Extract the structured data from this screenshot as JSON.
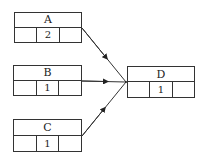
{
  "diagram": {
    "nodes": [
      {
        "id": "A",
        "label": "A",
        "cells": [
          "",
          "2",
          ""
        ],
        "x": 14,
        "y": 12,
        "w": 68,
        "h": 31
      },
      {
        "id": "B",
        "label": "B",
        "cells": [
          "",
          "1",
          ""
        ],
        "x": 13,
        "y": 65,
        "w": 69,
        "h": 31
      },
      {
        "id": "C",
        "label": "C",
        "cells": [
          "",
          "1",
          ""
        ],
        "x": 13,
        "y": 119,
        "w": 69,
        "h": 33
      },
      {
        "id": "D",
        "label": "D",
        "cells": [
          "",
          "1",
          ""
        ],
        "x": 127,
        "y": 66,
        "w": 68,
        "h": 32
      }
    ],
    "edges": [
      {
        "from": "A",
        "to": "D"
      },
      {
        "from": "B",
        "to": "D"
      },
      {
        "from": "C",
        "to": "D"
      }
    ],
    "colors": {
      "stroke": "#333333",
      "background": "#ffffff",
      "text": "#222222"
    }
  }
}
